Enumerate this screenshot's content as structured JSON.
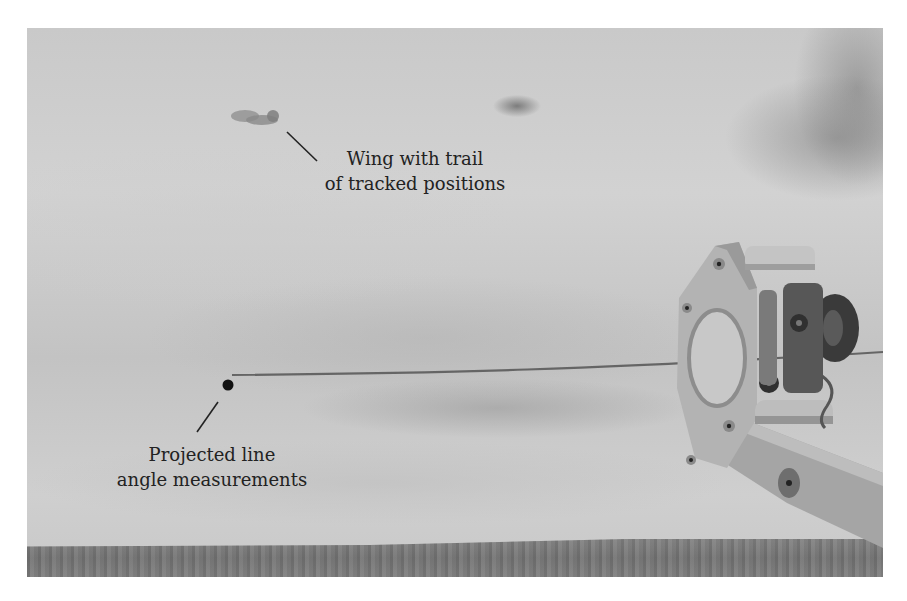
{
  "figure": {
    "colors": {
      "sky": "#cccccc",
      "ground": "#808080",
      "annotation_text": "#222222",
      "marker": "#111111"
    }
  },
  "annotations": {
    "wing": {
      "line1": "Wing with trail",
      "line2": "of tracked positions"
    },
    "line_angle": {
      "line1": "Projected line",
      "line2": "angle measurements"
    }
  }
}
